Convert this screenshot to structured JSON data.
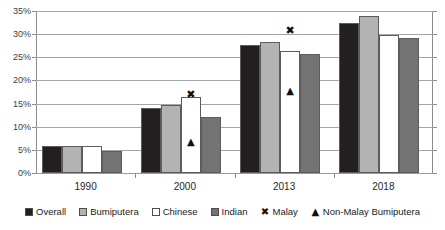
{
  "chart_data": {
    "type": "bar",
    "title": "",
    "subtitle": "",
    "xlabel": "",
    "ylabel": "",
    "categories": [
      "1990",
      "2000",
      "2013",
      "2018"
    ],
    "ylim": [
      0,
      35
    ],
    "ytick_labels": [
      "0%",
      "5%",
      "10%",
      "15%",
      "20%",
      "25%",
      "30%",
      "35%"
    ],
    "ytick_values": [
      0,
      5,
      10,
      15,
      20,
      25,
      30,
      35
    ],
    "grid": true,
    "legend_position": "bottom",
    "series": [
      {
        "name": "Overall",
        "marker": "square",
        "color": "#231f20",
        "values": [
          5.8,
          14.0,
          27.6,
          32.5
        ]
      },
      {
        "name": "Bumiputera",
        "marker": "square",
        "color": "#b3b3b3",
        "values": [
          5.8,
          14.8,
          28.3,
          33.9
        ]
      },
      {
        "name": "Chinese",
        "marker": "square",
        "color": "#ffffff",
        "values": [
          5.8,
          16.5,
          26.4,
          29.8
        ]
      },
      {
        "name": "Indian",
        "marker": "square",
        "color": "#737373",
        "values": [
          4.8,
          12.2,
          25.7,
          29.2
        ]
      },
      {
        "name": "Malay",
        "marker": "x",
        "glyph": "✖",
        "color": "#111111",
        "values": [
          null,
          17.0,
          31.0,
          null
        ]
      },
      {
        "name": "Non-Malay Bumiputera",
        "marker": "triangle",
        "glyph": "▲",
        "color": "#111111",
        "values": [
          null,
          6.8,
          17.8,
          null
        ]
      }
    ]
  },
  "legend": {
    "items": [
      {
        "label": "Overall",
        "glyph": "■",
        "type": "swatch",
        "color": "#231f20"
      },
      {
        "label": "Bumiputera",
        "glyph": "■",
        "type": "swatch",
        "color": "#b3b3b3"
      },
      {
        "label": "Chinese",
        "glyph": "□",
        "type": "swatch",
        "color": "#ffffff"
      },
      {
        "label": "Indian",
        "glyph": "■",
        "type": "swatch",
        "color": "#737373"
      },
      {
        "label": "Malay",
        "glyph": "✖",
        "type": "marker",
        "color": "#111111"
      },
      {
        "label": "Non-Malay Bumiputera",
        "glyph": "▲",
        "type": "marker",
        "color": "#111111"
      }
    ]
  }
}
